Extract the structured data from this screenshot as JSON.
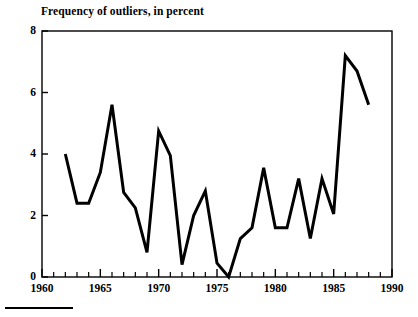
{
  "chart_data": {
    "type": "line",
    "title": "Frequency of outliers, in percent",
    "xlabel": "",
    "ylabel": "",
    "xlim": [
      1960,
      1990
    ],
    "ylim": [
      0,
      8
    ],
    "grid": false,
    "legend": null,
    "x_major_ticks": [
      1960,
      1965,
      1970,
      1975,
      1980,
      1985,
      1990
    ],
    "x_major_tick_labels": [
      "1960",
      "1965",
      "1970",
      "1975",
      "1980",
      "1985",
      "1990"
    ],
    "x_minor_tick_step": 1,
    "y_ticks": [
      0,
      2,
      4,
      6,
      8
    ],
    "y_tick_labels": [
      "0",
      "2",
      "4",
      "6",
      "8"
    ],
    "line_color": "#000000",
    "line_width": 3,
    "x": [
      1962,
      1963,
      1964,
      1965,
      1966,
      1967,
      1968,
      1969,
      1970,
      1971,
      1972,
      1973,
      1974,
      1975,
      1976,
      1977,
      1978,
      1979,
      1980,
      1981,
      1982,
      1983,
      1984,
      1985,
      1986,
      1987,
      1988
    ],
    "values": [
      4.0,
      2.4,
      2.4,
      3.4,
      5.6,
      2.75,
      2.25,
      0.8,
      4.75,
      3.95,
      0.4,
      2.0,
      2.8,
      0.45,
      0.0,
      1.25,
      1.6,
      3.55,
      1.6,
      1.6,
      3.2,
      1.25,
      3.2,
      2.05,
      7.2,
      6.7,
      5.6
    ]
  },
  "figure": {
    "footer_rule_name": "footer-rule"
  }
}
